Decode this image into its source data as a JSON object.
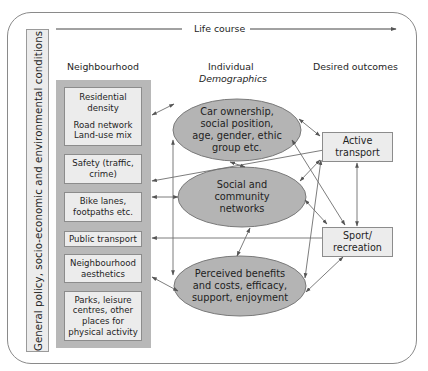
{
  "timeline": {
    "label": "Life course"
  },
  "side_label": "General policy, socio-economic and environmental conditions",
  "columns": {
    "neighbourhood": "Neighbourhood",
    "individual": "Individual",
    "individual_sub": "Demographics",
    "outcomes": "Desired outcomes"
  },
  "neighbourhood_items": [
    {
      "lines": [
        "Residential",
        "density",
        "",
        "Road network",
        "Land-use mix"
      ]
    },
    {
      "lines": [
        "Safety (traffic,",
        "crime)"
      ]
    },
    {
      "lines": [
        "Bike lanes,",
        "footpaths etc."
      ]
    },
    {
      "lines": [
        "Public transport"
      ]
    },
    {
      "lines": [
        "Neighbourhood",
        "aesthetics"
      ]
    },
    {
      "lines": [
        "Parks, leisure",
        "centres, other",
        "places for",
        "physical activity"
      ]
    }
  ],
  "individual_factors": [
    {
      "lines": [
        "Car ownership,",
        "social position,",
        "age, gender, ethic",
        "group etc."
      ]
    },
    {
      "lines": [
        "Social and",
        "community",
        "networks"
      ]
    },
    {
      "lines": [
        "Perceived benefits",
        "and costs, efficacy,",
        "support, enjoyment"
      ]
    }
  ],
  "outcomes": [
    {
      "lines": [
        "Active",
        "transport"
      ]
    },
    {
      "lines": [
        "Sport/",
        "recreation"
      ]
    }
  ],
  "colors": {
    "ellipse_fill": "#b4b4b4",
    "panel_fill": "#b8b8b8",
    "box_fill": "#ececec",
    "line": "#6e6e6e"
  }
}
